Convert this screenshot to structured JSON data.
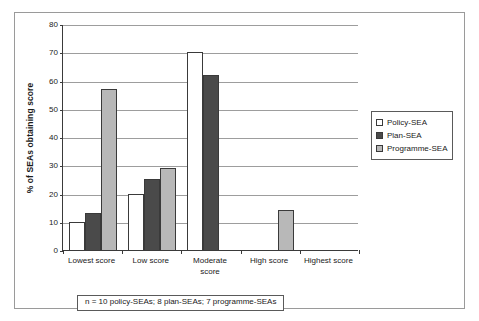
{
  "chart_data": {
    "type": "bar",
    "title": "",
    "subtitle": "",
    "xlabel": "",
    "ylabel": "% of SEAs obtaining score",
    "ylim": [
      0,
      80
    ],
    "yticks": [
      0,
      10,
      20,
      30,
      40,
      50,
      60,
      70,
      80
    ],
    "grid": true,
    "legend_position": "right",
    "categories": [
      "Lowest score",
      "Low score",
      "Moderate score",
      "High score",
      "Highest score"
    ],
    "category_lines": [
      [
        "Lowest score"
      ],
      [
        "Low score"
      ],
      [
        "Moderate",
        "score"
      ],
      [
        "High score"
      ],
      [
        "Highest score"
      ]
    ],
    "series": [
      {
        "name": "Policy-SEA",
        "color": "#ffffff",
        "values": [
          10,
          20,
          70,
          0,
          0
        ]
      },
      {
        "name": "Plan-SEA",
        "color": "#4a4a4a",
        "values": [
          13,
          25,
          62,
          0,
          0
        ]
      },
      {
        "name": "Programme-SEA",
        "color": "#b8b8b8",
        "values": [
          57,
          29,
          0,
          14,
          0
        ]
      }
    ],
    "annotation": "n = 10 policy-SEAs; 8 plan-SEAs; 7 programme-SEAs"
  },
  "legend": {
    "items": [
      {
        "label": "Policy-SEA",
        "color": "#ffffff"
      },
      {
        "label": "Plan-SEA",
        "color": "#4a4a4a"
      },
      {
        "label": "Programme-SEA",
        "color": "#b8b8b8"
      }
    ]
  },
  "footnote": {
    "text": "n = 10 policy-SEAs; 8 plan-SEAs; 7 programme-SEAs"
  },
  "axis": {
    "y_title": "% of SEAs obtaining score",
    "y_tick_labels": [
      "0",
      "10",
      "20",
      "30",
      "40",
      "50",
      "60",
      "70",
      "80"
    ]
  },
  "colors": {
    "axis": "#3a3a3a",
    "grid": "#9d9d9d",
    "frame": "#9a9a9a",
    "text": "#1a1a1a"
  }
}
